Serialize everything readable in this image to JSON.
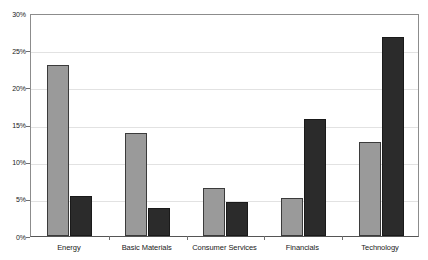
{
  "chart_data": {
    "type": "bar",
    "title": "",
    "xlabel": "",
    "ylabel": "",
    "categories": [
      "Energy",
      "Basic Materials",
      "Consumer Services",
      "Financials",
      "Technology"
    ],
    "series": [
      {
        "name": "Series 1",
        "color": "#9a9a9a",
        "values": [
          23.0,
          13.8,
          6.5,
          5.1,
          12.6
        ]
      },
      {
        "name": "Series 2",
        "color": "#2b2b2b",
        "values": [
          5.4,
          3.8,
          4.6,
          15.7,
          26.8
        ]
      }
    ],
    "ylim": [
      0,
      30
    ],
    "ytick_values": [
      0,
      5,
      10,
      15,
      20,
      25,
      30
    ],
    "ytick_labels": [
      "0%",
      "5%",
      "10%",
      "15%",
      "20%",
      "25%",
      "30%"
    ],
    "grid": true,
    "grid_axis": "y",
    "legend": false,
    "legend_position": "none",
    "annotations": []
  },
  "axes": {
    "y": {
      "ticks": [
        {
          "label": "30%",
          "value": 30
        },
        {
          "label": "25%",
          "value": 25
        },
        {
          "label": "20%",
          "value": 20
        },
        {
          "label": "15%",
          "value": 15
        },
        {
          "label": "10%",
          "value": 10
        },
        {
          "label": "5%",
          "value": 5
        },
        {
          "label": "0%",
          "value": 0
        }
      ]
    },
    "x": {
      "categories": [
        {
          "label": "Energy"
        },
        {
          "label": "Basic Materials"
        },
        {
          "label": "Consumer Services"
        },
        {
          "label": "Financials"
        },
        {
          "label": "Technology"
        }
      ]
    }
  },
  "style": {
    "bar_color_light": "#9a9a9a",
    "bar_color_dark": "#2b2b2b",
    "grid_color": "#e2e2e2",
    "axis_color": "#8c8c8c",
    "background": "#ffffff"
  }
}
